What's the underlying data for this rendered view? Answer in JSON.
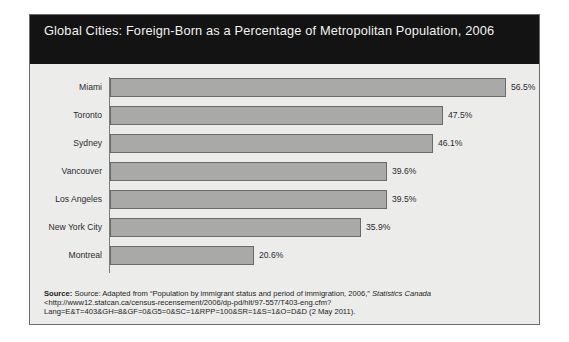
{
  "chart_title": "Global Cities: Foreign-Born as a Percentage of Metropolitan Population, 2006",
  "source": {
    "label": "Source:",
    "body_1": " Source: Adapted from “Population by immigrant status and period of immigration, 2006,” ",
    "italic_1": "Statistics Canada",
    "body_2": " <http://www12.statcan.ca/census-recensement/2006/dp-pd/hlt/97-557/T403-eng.cfm?Lang=E&T=403&GH=8&GF=0&G5=0&SC=1&RPP=100&SR=1&S=1&O=D&D (2 May 2011)."
  },
  "colors": {
    "title_band": "#131313",
    "title_text": "#f2f2f0",
    "panel_background": "#ececeb",
    "bar_fill": "#a9a9a7",
    "bar_border": "#6a6a6a",
    "frame_border": "#6d6d6d"
  },
  "chart_data": {
    "type": "bar",
    "orientation": "horizontal",
    "title": "Global Cities: Foreign-Born as a Percentage of Metropolitan Population, 2006",
    "xlabel": "",
    "ylabel": "",
    "xlim": [
      0,
      60
    ],
    "grid": false,
    "legend": null,
    "categories": [
      "Miami",
      "Toronto",
      "Sydney",
      "Vancouver",
      "Los Angeles",
      "New York City",
      "Montreal"
    ],
    "values": [
      56.5,
      47.5,
      46.1,
      39.6,
      39.5,
      35.9,
      20.6
    ],
    "value_labels": [
      "56.5%",
      "47.5%",
      "46.1%",
      "39.6%",
      "39.5%",
      "35.9%",
      "20.6%"
    ],
    "bars": [
      {
        "category": "Miami",
        "value": 56.5,
        "label": "56.5%"
      },
      {
        "category": "Toronto",
        "value": 47.5,
        "label": "47.5%"
      },
      {
        "category": "Sydney",
        "value": 46.1,
        "label": "46.1%"
      },
      {
        "category": "Vancouver",
        "value": 39.6,
        "label": "39.6%"
      },
      {
        "category": "Los Angeles",
        "value": 39.5,
        "label": "39.5%"
      },
      {
        "category": "New York City",
        "value": 35.9,
        "label": "35.9%"
      },
      {
        "category": "Montreal",
        "value": 20.6,
        "label": "20.6%"
      }
    ]
  }
}
